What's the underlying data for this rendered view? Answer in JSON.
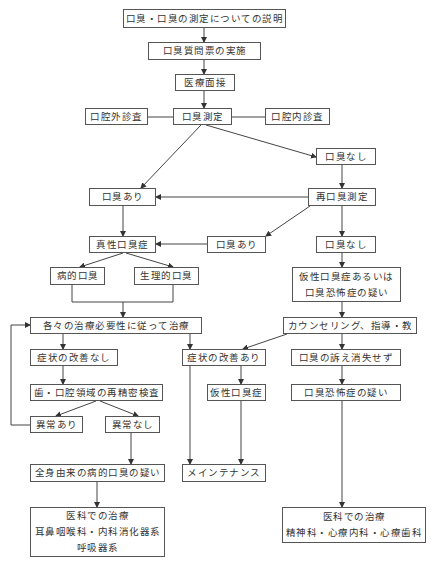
{
  "diagram": {
    "type": "flowchart",
    "nodes": {
      "explain": {
        "label": "口臭・口臭の測定についての説明"
      },
      "questionnaire": {
        "label": "口臭質問票の実施"
      },
      "interview": {
        "label": "医療面接"
      },
      "measure": {
        "label": "口臭測定"
      },
      "extraoral": {
        "label": "口腔外診査"
      },
      "intraoral": {
        "label": "口腔内診査"
      },
      "no_odor_1": {
        "label": "口臭なし"
      },
      "odor_1": {
        "label": "口臭あり"
      },
      "remeasure": {
        "label": "再口臭測定"
      },
      "genuine": {
        "label": "真性口臭症"
      },
      "odor_2": {
        "label": "口臭あり"
      },
      "no_odor_2": {
        "label": "口臭なし"
      },
      "pathologic": {
        "label": "病的口臭"
      },
      "physiologic": {
        "label": "生理的口臭"
      },
      "pseudo_or_phobia": {
        "line1": "仮性口臭症あるいは",
        "line2": "口臭恐怖症の疑い"
      },
      "treat_per_need": {
        "label": "各々の治療必要性に従って治療"
      },
      "counseling": {
        "label": "カウンセリング、指導・教"
      },
      "no_improve": {
        "label": "症状の改善なし"
      },
      "improve": {
        "label": "症状の改善あり"
      },
      "complaint_persists": {
        "label": "口臭の訴え消失せず"
      },
      "reexam": {
        "label": "歯・口腔領域の再精密検査"
      },
      "pseudo": {
        "label": "仮性口臭症"
      },
      "phobia_suspect": {
        "label": "口臭恐怖症の疑い"
      },
      "abnormal": {
        "label": "異常あり"
      },
      "normal": {
        "label": "異常なし"
      },
      "systemic": {
        "label": "全身由来の病的口臭の疑い"
      },
      "maintenance": {
        "label": "メインテナンス"
      },
      "medical_1": {
        "line1": "医科での治療",
        "line2": "耳鼻咽喉科・内科消化器系",
        "line3": "呼吸器系"
      },
      "medical_2": {
        "line1": "医科での治療",
        "line2": "精神科・心療内科・心療歯科"
      }
    },
    "edges": [
      [
        "explain",
        "questionnaire"
      ],
      [
        "questionnaire",
        "interview"
      ],
      [
        "interview",
        "measure"
      ],
      [
        "measure",
        "extraoral"
      ],
      [
        "measure",
        "intraoral"
      ],
      [
        "measure",
        "odor_1"
      ],
      [
        "measure",
        "no_odor_1"
      ],
      [
        "no_odor_1",
        "remeasure"
      ],
      [
        "remeasure",
        "odor_1"
      ],
      [
        "remeasure",
        "odor_2"
      ],
      [
        "remeasure",
        "no_odor_2"
      ],
      [
        "odor_1",
        "genuine"
      ],
      [
        "odor_2",
        "genuine"
      ],
      [
        "genuine",
        "pathologic"
      ],
      [
        "genuine",
        "physiologic"
      ],
      [
        "pathologic",
        "treat_per_need"
      ],
      [
        "physiologic",
        "treat_per_need"
      ],
      [
        "no_odor_2",
        "pseudo_or_phobia"
      ],
      [
        "pseudo_or_phobia",
        "counseling"
      ],
      [
        "treat_per_need",
        "no_improve"
      ],
      [
        "treat_per_need",
        "maintenance"
      ],
      [
        "counseling",
        "improve"
      ],
      [
        "counseling",
        "complaint_persists"
      ],
      [
        "no_improve",
        "reexam"
      ],
      [
        "reexam",
        "abnormal"
      ],
      [
        "reexam",
        "normal"
      ],
      [
        "abnormal",
        "treat_per_need"
      ],
      [
        "normal",
        "systemic"
      ],
      [
        "improve",
        "pseudo"
      ],
      [
        "pseudo",
        "maintenance"
      ],
      [
        "complaint_persists",
        "phobia_suspect"
      ],
      [
        "phobia_suspect",
        "medical_2"
      ],
      [
        "systemic",
        "medical_1"
      ]
    ],
    "colors": {
      "line": "#444444",
      "border": "#555555",
      "text": "#333333",
      "background": "#ffffff"
    }
  }
}
